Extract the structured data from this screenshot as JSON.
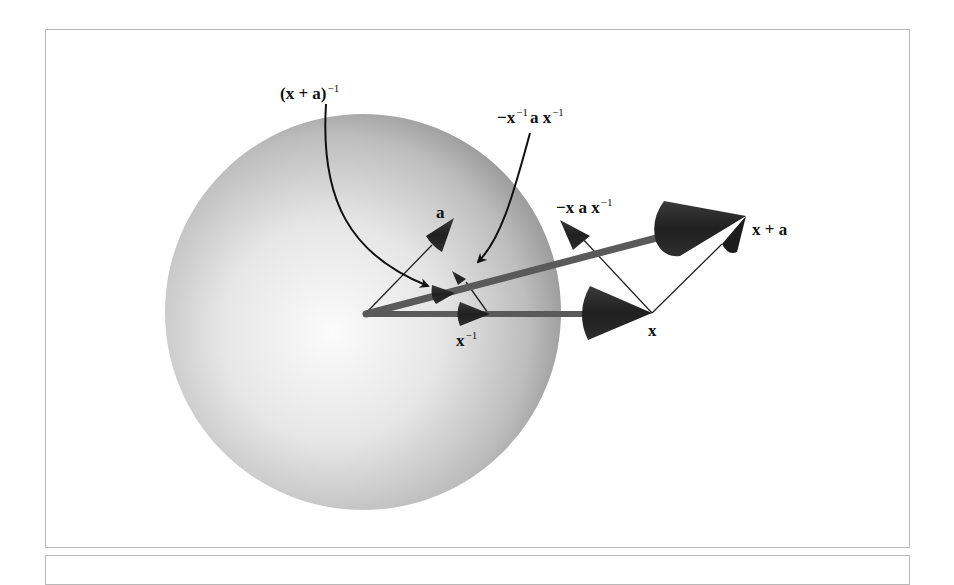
{
  "figure": {
    "labels": {
      "x_plus_a_inverse": {
        "base": "(x + a)",
        "sup": "−1"
      },
      "neg_xinv_a_xinv": {
        "pre": "−x",
        "sup1": "−1",
        "mid": "a x",
        "sup2": "−1"
      },
      "neg_x_a_xinv": {
        "base": "−x a x",
        "sup": "−1"
      },
      "a": "a",
      "x_plus_a": "x + a",
      "x_inverse": {
        "base": "x",
        "sup": "−1"
      },
      "x": "x"
    },
    "colors": {
      "sphere_light": "#f4f4f4",
      "sphere_dark": "#8e8e8e",
      "vector_shaft": "#5a5a5a",
      "cone": "#262626",
      "thin_line": "#222222",
      "frame_border": "#b8b8b8"
    }
  }
}
